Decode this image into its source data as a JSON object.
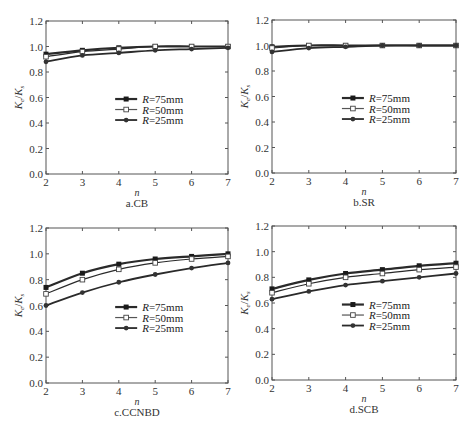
{
  "figure": {
    "panels": [
      {
        "id": "a",
        "caption": "a.CB"
      },
      {
        "id": "b",
        "caption": "b.SR"
      },
      {
        "id": "c",
        "caption": "c.CCNBD"
      },
      {
        "id": "d",
        "caption": "d.SCB"
      }
    ]
  },
  "chart_data": [
    {
      "type": "line",
      "title": "a.CB",
      "xlabel": "n",
      "ylabel": "Ke/Ks",
      "x": [
        2,
        3,
        4,
        5,
        6,
        7
      ],
      "xlim": [
        2,
        7
      ],
      "ylim": [
        0.0,
        1.2
      ],
      "yticks": [
        "0.0",
        "0.2",
        "0.4",
        "0.6",
        "0.8",
        "1.0",
        "1.2"
      ],
      "xticks": [
        "2",
        "3",
        "4",
        "5",
        "6",
        "7"
      ],
      "grid": false,
      "legend_position": "center-right",
      "series": [
        {
          "name": "R=75mm",
          "marker": "filled-square",
          "values": [
            0.94,
            0.97,
            0.99,
            1.0,
            1.0,
            1.0
          ]
        },
        {
          "name": "R=50mm",
          "marker": "open-square",
          "values": [
            0.92,
            0.96,
            0.98,
            1.0,
            1.0,
            1.0
          ]
        },
        {
          "name": "R=25mm",
          "marker": "filled-circle",
          "values": [
            0.88,
            0.93,
            0.95,
            0.97,
            0.98,
            0.99
          ]
        }
      ]
    },
    {
      "type": "line",
      "title": "b.SR",
      "xlabel": "n",
      "ylabel": "Ke/Ks",
      "x": [
        2,
        3,
        4,
        5,
        6,
        7
      ],
      "xlim": [
        2,
        7
      ],
      "ylim": [
        0.0,
        1.2
      ],
      "yticks": [
        "0.0",
        "0.2",
        "0.4",
        "0.6",
        "0.8",
        "1.0",
        "1.2"
      ],
      "xticks": [
        "2",
        "3",
        "4",
        "5",
        "6",
        "7"
      ],
      "grid": false,
      "legend_position": "center-right",
      "series": [
        {
          "name": "R=75mm",
          "marker": "filled-square",
          "values": [
            0.99,
            1.0,
            1.0,
            1.0,
            1.0,
            1.0
          ]
        },
        {
          "name": "R=50mm",
          "marker": "open-square",
          "values": [
            0.98,
            1.0,
            1.0,
            1.0,
            1.0,
            1.0
          ]
        },
        {
          "name": "R=25mm",
          "marker": "filled-circle",
          "values": [
            0.95,
            0.98,
            0.99,
            1.0,
            1.0,
            1.0
          ]
        }
      ]
    },
    {
      "type": "line",
      "title": "c.CCNBD",
      "xlabel": "n",
      "ylabel": "Ke/Ks",
      "x": [
        2,
        3,
        4,
        5,
        6,
        7
      ],
      "xlim": [
        2,
        7
      ],
      "ylim": [
        0.0,
        1.2
      ],
      "yticks": [
        "0.0",
        "0.2",
        "0.4",
        "0.6",
        "0.8",
        "1.0",
        "1.2"
      ],
      "xticks": [
        "2",
        "3",
        "4",
        "5",
        "6",
        "7"
      ],
      "grid": false,
      "legend_position": "center-right",
      "series": [
        {
          "name": "R=75mm",
          "marker": "filled-square",
          "values": [
            0.74,
            0.85,
            0.92,
            0.96,
            0.98,
            1.0
          ]
        },
        {
          "name": "R=50mm",
          "marker": "open-square",
          "values": [
            0.69,
            0.8,
            0.88,
            0.93,
            0.96,
            0.98
          ]
        },
        {
          "name": "R=25mm",
          "marker": "filled-circle",
          "values": [
            0.6,
            0.7,
            0.78,
            0.84,
            0.89,
            0.93
          ]
        }
      ]
    },
    {
      "type": "line",
      "title": "d.SCB",
      "xlabel": "n",
      "ylabel": "Ke/Ks",
      "x": [
        2,
        3,
        4,
        5,
        6,
        7
      ],
      "xlim": [
        2,
        7
      ],
      "ylim": [
        0.0,
        1.2
      ],
      "yticks": [
        "0.0",
        "0.2",
        "0.4",
        "0.6",
        "0.8",
        "1.0",
        "1.2"
      ],
      "xticks": [
        "2",
        "3",
        "4",
        "5",
        "6",
        "7"
      ],
      "grid": false,
      "legend_position": "center-right",
      "series": [
        {
          "name": "R=75mm",
          "marker": "filled-square",
          "values": [
            0.71,
            0.78,
            0.83,
            0.86,
            0.89,
            0.91
          ]
        },
        {
          "name": "R=50mm",
          "marker": "open-square",
          "values": [
            0.68,
            0.75,
            0.8,
            0.83,
            0.86,
            0.88
          ]
        },
        {
          "name": "R=25mm",
          "marker": "filled-circle",
          "values": [
            0.63,
            0.69,
            0.74,
            0.77,
            0.8,
            0.83
          ]
        }
      ]
    }
  ],
  "style": {
    "line_color": "#2a2a2a",
    "axis_color": "#555555",
    "background": "#ffffff"
  }
}
